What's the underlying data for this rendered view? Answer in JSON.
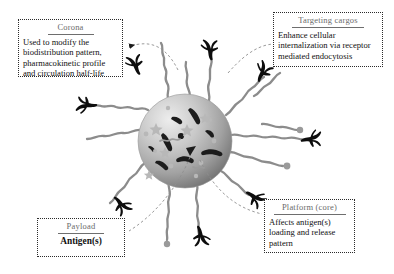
{
  "figure": {
    "type": "nanoparticle-vaccine-schematic",
    "background_color": "#ffffff",
    "ink_color": "#111111",
    "title_color": "#6b6b6b"
  },
  "particle": {
    "label": "nanoparticle-core",
    "core_color_light": "#e6e6e6",
    "core_color_dark": "#6f6f6f",
    "corona_chain_color": "#8c8c8c",
    "targeting_ligand_color": "#0d0d0d",
    "antigen_color": "#1a1a1a",
    "center_x": 185,
    "center_y": 141,
    "radius": 47,
    "corona_chain_count": 12,
    "targeting_ligand_count": 7
  },
  "callouts": [
    {
      "id": "corona",
      "title": "Corona",
      "body": "Used to modify the biodistribution pattern, pharmacokinetic profile and circulation half-life",
      "bold": false,
      "align": "left"
    },
    {
      "id": "targeting_cargos",
      "title": "Targeting cargos",
      "body": "Enhance cellular internalization via receptor mediated endocytosis",
      "bold": false,
      "align": "left"
    },
    {
      "id": "payload",
      "title": "Payload",
      "body": "Antigen(s)",
      "bold": true,
      "align": "center"
    },
    {
      "id": "platform_core",
      "title": "Platform (core)",
      "body": "Affects antigen(s) loading and release pattern",
      "bold": false,
      "align": "left"
    }
  ],
  "leaders": {
    "style": "dashed",
    "color": "#8a8a8a",
    "arrowheads": 2
  }
}
